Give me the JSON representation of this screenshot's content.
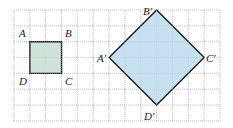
{
  "figure": {
    "grid": {
      "columns": 13,
      "rows": 7
    },
    "colors": {
      "small_fill": "#cfe3d8",
      "large_fill": "#c6e1f2",
      "stroke": "#1a1a1a",
      "grid": "#b9bcc0"
    },
    "small_square": {
      "vertices_grid": [
        [
          1,
          2
        ],
        [
          3,
          2
        ],
        [
          3,
          4
        ],
        [
          1,
          4
        ]
      ],
      "labels": [
        "A",
        "B",
        "C",
        "D"
      ]
    },
    "large_square": {
      "vertices_grid": [
        [
          6,
          3
        ],
        [
          9,
          0
        ],
        [
          12,
          3
        ],
        [
          9,
          6
        ]
      ],
      "labels": [
        "A′",
        "B′",
        "C′",
        "D′"
      ]
    }
  }
}
